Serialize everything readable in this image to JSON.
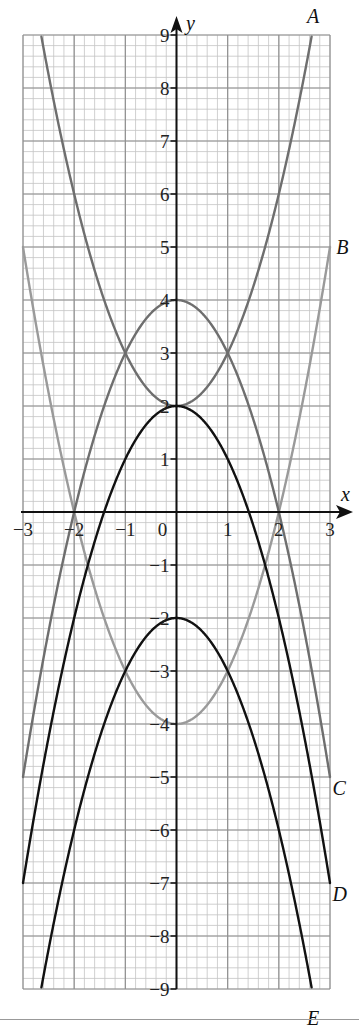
{
  "chart_data": {
    "type": "line",
    "title": "",
    "xlabel": "x",
    "ylabel": "y",
    "xlim": [
      -3,
      3
    ],
    "ylim": [
      -9,
      9
    ],
    "grid": true,
    "minor_grid_step": 0.2,
    "x_ticks": [
      -3,
      -2,
      -1,
      0,
      1,
      2,
      3
    ],
    "x_tick_labels": [
      "-3",
      "-2",
      "-1",
      "0",
      "1",
      "2",
      "3"
    ],
    "y_ticks": [
      -9,
      -8,
      -7,
      -6,
      -5,
      -4,
      -3,
      -2,
      -1,
      1,
      2,
      3,
      4,
      5,
      6,
      7,
      8,
      9
    ],
    "y_tick_labels": [
      "-9",
      "-8",
      "-7",
      "-6",
      "-5",
      "-4",
      "-3",
      "-2",
      "-1",
      "1",
      "2",
      "3",
      "4",
      "5",
      "6",
      "7",
      "8",
      "9"
    ],
    "origin_label": "0",
    "series": [
      {
        "name": "A",
        "equation": "y = x^2 + 2",
        "color": "#6e6e6e",
        "label_pos": [
          2.55,
          9.35
        ],
        "x": [
          -2.65,
          -2,
          -1,
          0,
          1,
          2,
          2.65
        ],
        "values": [
          9,
          6,
          3,
          2,
          3,
          6,
          9
        ]
      },
      {
        "name": "B",
        "equation": "y = x^2 - 4",
        "color": "#9a9a9a",
        "label_pos": [
          3.12,
          5.0
        ],
        "x": [
          -3,
          -2,
          -1,
          0,
          1,
          2,
          3
        ],
        "values": [
          5,
          0,
          -3,
          -4,
          -3,
          0,
          5
        ]
      },
      {
        "name": "C",
        "equation": "y = 4 - x^2",
        "color": "#6e6e6e",
        "label_pos": [
          3.05,
          -5.2
        ],
        "x": [
          -3,
          -2,
          -1,
          0,
          1,
          2,
          3
        ],
        "values": [
          -5,
          0,
          3,
          4,
          3,
          0,
          -5
        ]
      },
      {
        "name": "D",
        "equation": "y = 2 - x^2",
        "color": "#111111",
        "label_pos": [
          3.05,
          -7.2
        ],
        "x": [
          -3,
          -2,
          -1,
          0,
          1,
          2,
          3
        ],
        "values": [
          -7,
          -2,
          1,
          2,
          1,
          -2,
          -7
        ]
      },
      {
        "name": "E",
        "equation": "y = -2 - x^2",
        "color": "#111111",
        "label_pos": [
          2.55,
          -9.55
        ],
        "x": [
          -2.65,
          -2,
          -1,
          0,
          1,
          2,
          2.65
        ],
        "values": [
          -9,
          -6,
          -3,
          -2,
          -3,
          -6,
          -9
        ]
      }
    ]
  },
  "colors": {
    "minor_grid": "#c4c4c4",
    "major_grid": "#8f8f8f",
    "axis": "#111111"
  }
}
